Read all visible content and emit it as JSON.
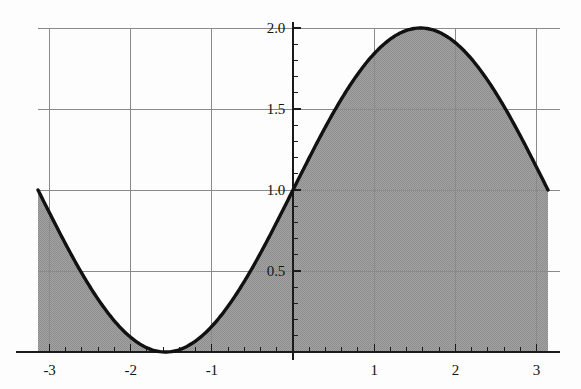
{
  "chart_data": {
    "type": "area",
    "title": "",
    "subtitle": "",
    "xlabel": "",
    "ylabel": "",
    "function": "y = 1 + sin(x)",
    "xlim": [
      -3.14159,
      3.14159
    ],
    "ylim": [
      0,
      2.05
    ],
    "grid": true,
    "legend": false,
    "legend_position": "none",
    "fill": "area under curve shaded gray from y=0 to y=1+sin(x)",
    "x_ticks": [
      -3,
      -2,
      -1,
      1,
      2,
      3
    ],
    "x_tick_labels": [
      "-3",
      "-2",
      "-1",
      "1",
      "2",
      "3"
    ],
    "y_ticks": [
      0.5,
      1.0,
      1.5,
      2.0
    ],
    "y_tick_labels": [
      "0.5",
      "1.0",
      "1.5",
      "2.0"
    ],
    "x_minor_per_major": 5,
    "y_minor_per_major": 5,
    "series": [
      {
        "name": "1 + sin(x)",
        "x": [
          -3.1416,
          -3.0,
          -2.8,
          -2.6,
          -2.4,
          -2.2,
          -2.0,
          -1.8,
          -1.5708,
          -1.4,
          -1.2,
          -1.0,
          -0.8,
          -0.6,
          -0.4,
          -0.2,
          0.0,
          0.2,
          0.4,
          0.6,
          0.8,
          1.0,
          1.2,
          1.4,
          1.5708,
          1.8,
          2.0,
          2.2,
          2.4,
          2.6,
          2.8,
          3.0,
          3.1416
        ],
        "y": [
          1.0,
          0.8589,
          0.665,
          0.4845,
          0.3246,
          0.1915,
          0.0907,
          0.026,
          0.0,
          0.0143,
          0.068,
          0.1585,
          0.2826,
          0.4353,
          0.6106,
          0.8013,
          1.0,
          1.1987,
          1.3894,
          1.5646,
          1.7174,
          1.8415,
          1.932,
          1.9854,
          2.0,
          1.9738,
          1.9093,
          1.8085,
          1.6755,
          1.5155,
          1.335,
          1.1411,
          1.0
        ]
      }
    ],
    "annotations": [],
    "colors": {
      "curve": "#111111",
      "fill": "#9b9b9b",
      "gridline": "#8a8a8a",
      "axis": "#1a1a1a",
      "background": "#fdfdfd",
      "tick_label": "#141414"
    },
    "notable_points": {
      "minimum": {
        "x": -1.5708,
        "y": 0
      },
      "maximum": {
        "x": 1.5708,
        "y": 2.0
      },
      "left_endpoint": {
        "x": -3.1416,
        "y": 1.0
      },
      "right_endpoint": {
        "x": 3.1416,
        "y": 1.0
      },
      "y_intercept": {
        "x": 0,
        "y": 1.0
      }
    }
  }
}
